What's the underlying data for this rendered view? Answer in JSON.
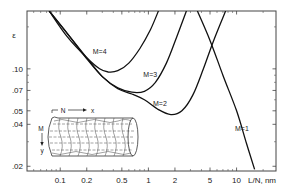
{
  "chart_data": {
    "type": "line",
    "title": "",
    "xlabel": "L/N, nm",
    "ylabel": "ε",
    "xscale": "log",
    "yscale": "log",
    "xlim": [
      0.042,
      28
    ],
    "ylim": [
      0.0185,
      0.26
    ],
    "grid": false,
    "legend": "inline curve labels",
    "x_ticks": [
      {
        "value": 0.1,
        "label": "0.1"
      },
      {
        "value": 0.2,
        "label": "0.2"
      },
      {
        "value": 0.5,
        "label": "0.5"
      },
      {
        "value": 1,
        "label": "1"
      },
      {
        "value": 2,
        "label": "2"
      },
      {
        "value": 5,
        "label": "5"
      },
      {
        "value": 10,
        "label": "10"
      }
    ],
    "y_ticks": [
      {
        "value": 0.1,
        "label": ".10"
      },
      {
        "value": 0.07,
        "label": ".07"
      },
      {
        "value": 0.05,
        "label": ".05"
      },
      {
        "value": 0.04,
        "label": ".04"
      },
      {
        "value": 0.02,
        "label": ".02"
      }
    ],
    "series": [
      {
        "name": "M=1",
        "label": "M=1",
        "label_pos": {
          "x": 11.5,
          "y": 0.036
        },
        "points": [
          [
            3.6,
            0.26
          ],
          [
            5.0,
            0.16
          ],
          [
            7.0,
            0.09
          ],
          [
            10.0,
            0.05
          ],
          [
            13.0,
            0.029
          ],
          [
            16.0,
            0.019
          ]
        ]
      },
      {
        "name": "M=2",
        "label": "M=2",
        "label_pos": {
          "x": 1.35,
          "y": 0.054
        },
        "points": [
          [
            0.075,
            0.26
          ],
          [
            0.12,
            0.18
          ],
          [
            0.2,
            0.12
          ],
          [
            0.3,
            0.088
          ],
          [
            0.45,
            0.072
          ],
          [
            0.65,
            0.066
          ],
          [
            0.9,
            0.06
          ],
          [
            1.3,
            0.051
          ],
          [
            1.8,
            0.047
          ],
          [
            2.4,
            0.05
          ],
          [
            3.2,
            0.065
          ],
          [
            4.2,
            0.1
          ],
          [
            5.5,
            0.16
          ],
          [
            7.5,
            0.26
          ]
        ]
      },
      {
        "name": "M=3",
        "label": "M=3",
        "label_pos": {
          "x": 1.05,
          "y": 0.088
        },
        "points": [
          [
            0.075,
            0.26
          ],
          [
            0.12,
            0.18
          ],
          [
            0.2,
            0.118
          ],
          [
            0.3,
            0.088
          ],
          [
            0.45,
            0.073
          ],
          [
            0.65,
            0.068
          ],
          [
            0.9,
            0.069
          ],
          [
            1.2,
            0.08
          ],
          [
            1.6,
            0.11
          ],
          [
            2.1,
            0.17
          ],
          [
            2.7,
            0.26
          ]
        ]
      },
      {
        "name": "M=4",
        "label": "M=4",
        "label_pos": {
          "x": 0.28,
          "y": 0.128
        },
        "points": [
          [
            0.075,
            0.26
          ],
          [
            0.12,
            0.17
          ],
          [
            0.2,
            0.12
          ],
          [
            0.28,
            0.1
          ],
          [
            0.35,
            0.095
          ],
          [
            0.45,
            0.097
          ],
          [
            0.6,
            0.11
          ],
          [
            0.8,
            0.14
          ],
          [
            1.05,
            0.19
          ],
          [
            1.3,
            0.26
          ]
        ]
      }
    ],
    "inset": {
      "description": "Tube/nanotube with deformed lattice grid",
      "labels": {
        "n": "N",
        "x": "x",
        "m": "M",
        "y": "y"
      }
    }
  }
}
